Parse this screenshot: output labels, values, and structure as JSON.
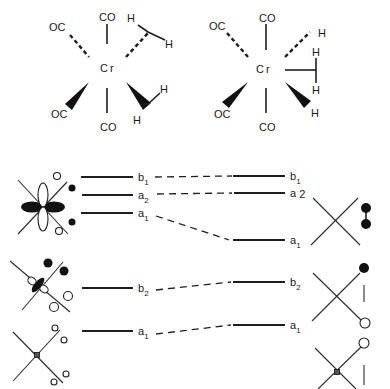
{
  "structures": [
    {
      "metal": "Cr",
      "ligands": {
        "top": "CO",
        "bottom": "CO",
        "upper_left": "OC",
        "lower_left": "OC"
      },
      "hydrogens": [
        "H",
        "H",
        "H",
        "H"
      ]
    },
    {
      "metal": "Cr",
      "ligands": {
        "top": "CO",
        "bottom": "CO",
        "upper_left": "OC",
        "lower_left": "OC"
      },
      "hydrogens": [
        "H",
        "H",
        "H",
        "H"
      ]
    }
  ],
  "correlation": {
    "left_levels": [
      {
        "sym": "b",
        "sub": "1"
      },
      {
        "sym": "a",
        "sub": "2"
      },
      {
        "sym": "a",
        "sub": "1"
      },
      {
        "sym": "b",
        "sub": "2"
      },
      {
        "sym": "a",
        "sub": "1"
      }
    ],
    "right_levels": [
      {
        "sym": "b",
        "sub": "1"
      },
      {
        "sym": "a",
        "sub": " 2"
      },
      {
        "sym": "a",
        "sub": "1"
      },
      {
        "sym": "b",
        "sub": "2"
      },
      {
        "sym": "a",
        "sub": "1"
      }
    ]
  }
}
